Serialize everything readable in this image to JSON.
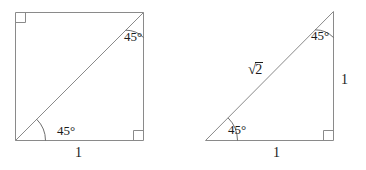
{
  "figure": {
    "kind": "geometry-diagram",
    "stroke_color": "#8a8a8a",
    "text_color": "#1b1b1b",
    "background_color": "#ffffff",
    "left_figure": {
      "name": "unit-square-with-diagonal",
      "shape": "square",
      "angle_labels": [
        {
          "id": "bottom-left",
          "text": "45°"
        },
        {
          "id": "top-right",
          "text": "45°"
        }
      ],
      "side_labels": [
        {
          "id": "bottom",
          "text": "1"
        }
      ],
      "right_angle_marks": [
        {
          "id": "top-left"
        },
        {
          "id": "bottom-right"
        }
      ]
    },
    "right_figure": {
      "name": "isosceles-right-triangle",
      "shape": "triangle",
      "angle_labels": [
        {
          "id": "bottom-left",
          "text": "45°"
        },
        {
          "id": "top",
          "text": "45°"
        }
      ],
      "side_labels": [
        {
          "id": "bottom",
          "text": "1"
        },
        {
          "id": "right",
          "text": "1"
        }
      ],
      "hypotenuse_label": {
        "id": "hypotenuse",
        "radical_sign": "√",
        "radicand": "2",
        "text": "√2"
      },
      "right_angle_marks": [
        {
          "id": "bottom-right"
        }
      ]
    }
  }
}
